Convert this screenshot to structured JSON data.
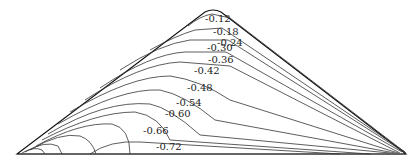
{
  "diagram": {
    "type": "contour",
    "shape": "triangular cross-section",
    "colors": {
      "line": "#333333",
      "background": "#ffffff"
    },
    "outline": {
      "peak": [
        213,
        10
      ],
      "left_base": [
        17,
        154
      ],
      "right_base": [
        406,
        154
      ]
    },
    "contour_labels": [
      {
        "text": "-0.12",
        "x": 205,
        "y": 22
      },
      {
        "text": "-0.18",
        "x": 213,
        "y": 35
      },
      {
        "text": "-0.24",
        "x": 217,
        "y": 46
      },
      {
        "text": "-0.30",
        "x": 207,
        "y": 51
      },
      {
        "text": "-0.36",
        "x": 208,
        "y": 63
      },
      {
        "text": "-0.42",
        "x": 194,
        "y": 74
      },
      {
        "text": "-0.48",
        "x": 187,
        "y": 91
      },
      {
        "text": "-0.54",
        "x": 176,
        "y": 106
      },
      {
        "text": "-0.60",
        "x": 165,
        "y": 117
      },
      {
        "text": "-0.66",
        "x": 143,
        "y": 134
      },
      {
        "text": "-0.72",
        "x": 156,
        "y": 150
      }
    ]
  }
}
